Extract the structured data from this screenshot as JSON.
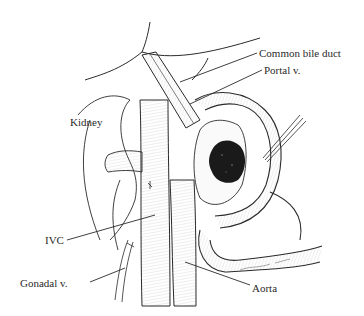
{
  "figure": {
    "type": "anatomical-illustration",
    "line_color": "#2a2a2a",
    "tumor_color": "#1a1a1a",
    "background": "#ffffff"
  },
  "labels": {
    "common_bile_duct": "Common bile duct",
    "portal_vein": "Portal v.",
    "kidney": "Kidney",
    "ivc": "IVC",
    "gonadal_vein": "Gonadal v.",
    "aorta": "Aorta"
  }
}
